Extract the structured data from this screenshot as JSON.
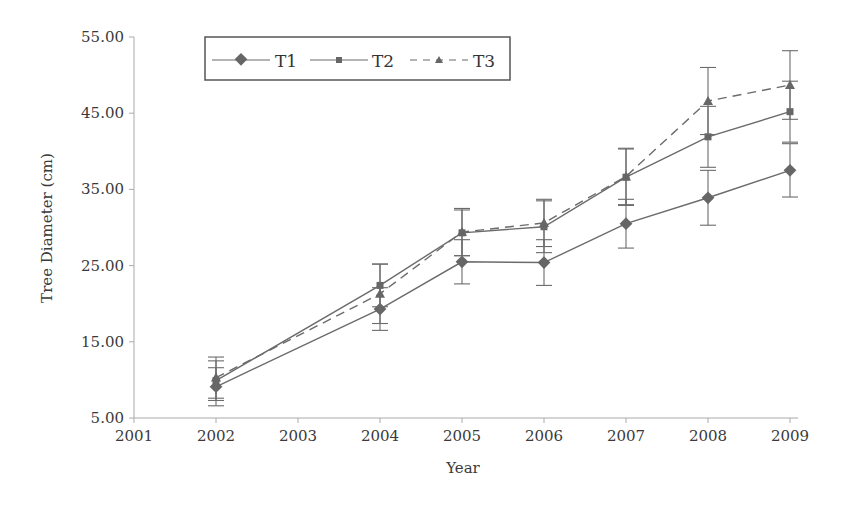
{
  "chart_data": {
    "type": "line",
    "title": "",
    "xlabel": "Year",
    "ylabel": "Tree Diameter (cm)",
    "x_tick_labels": [
      "2001",
      "2002",
      "2003",
      "2004",
      "2005",
      "2006",
      "2007",
      "2008",
      "2009"
    ],
    "y_tick_labels": [
      "5.00",
      "15.00",
      "25.00",
      "35.00",
      "45.00",
      "55.00"
    ],
    "ylim": [
      5,
      55
    ],
    "grid": false,
    "legend_position": "top-left",
    "x": [
      "2002",
      "2004",
      "2005",
      "2006",
      "2007",
      "2008",
      "2009"
    ],
    "x_positions": [
      1,
      3,
      4,
      5,
      6,
      7,
      8
    ],
    "series": [
      {
        "name": "T1",
        "marker": "diamond",
        "dash": "solid",
        "values": [
          9.1,
          19.3,
          25.5,
          25.4,
          30.5,
          33.9,
          37.5
        ],
        "err": [
          2.5,
          2.8,
          2.9,
          3.0,
          3.2,
          3.6,
          3.5
        ]
      },
      {
        "name": "T2",
        "marker": "square",
        "dash": "solid",
        "values": [
          9.9,
          22.4,
          29.3,
          30.1,
          36.6,
          41.9,
          45.2
        ],
        "err": [
          2.6,
          2.8,
          3.0,
          3.4,
          3.7,
          4.0,
          4.0
        ]
      },
      {
        "name": "T3",
        "marker": "triangle",
        "dash": "dashed",
        "values": [
          10.3,
          21.3,
          29.4,
          30.6,
          36.7,
          46.6,
          48.7
        ],
        "err": [
          2.7,
          3.9,
          3.1,
          3.1,
          3.7,
          4.4,
          4.5
        ]
      }
    ]
  },
  "legend": {
    "items": [
      "T1",
      "T2",
      "T3"
    ]
  },
  "colors": {
    "line": "#6b6b6b",
    "marker": "#666666",
    "axis": "#aaaaaa",
    "text": "#3a3a3a"
  }
}
